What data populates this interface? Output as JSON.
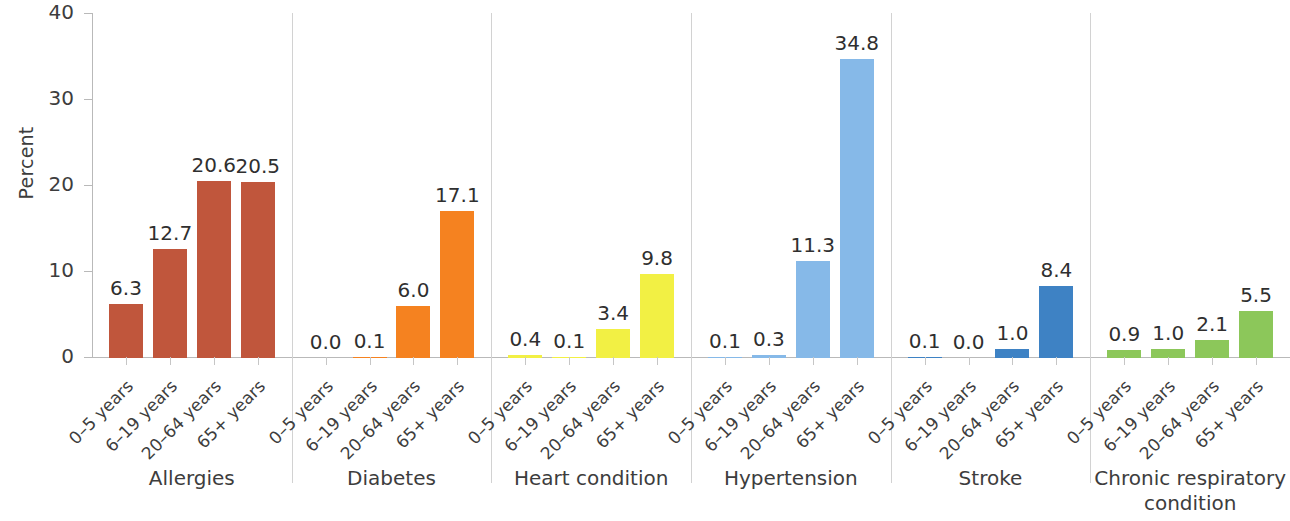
{
  "chart_data": {
    "type": "bar",
    "title": "",
    "xlabel": "",
    "ylabel": "Percent",
    "ylim": [
      0,
      40
    ],
    "yticks": [
      0,
      10,
      20,
      30,
      40
    ],
    "ytick_labels": [
      "0",
      "10",
      "20",
      "30",
      "40"
    ],
    "grid": false,
    "legend": "none",
    "categories": [
      "0–5 years",
      "6–19 years",
      "20–64 years",
      "65+ years"
    ],
    "groups": [
      {
        "name": "Allergies",
        "color": "#C0563C",
        "categories": [
          "0–5 years",
          "6–19 years",
          "20–64 years",
          "65+ years"
        ],
        "values": [
          6.3,
          12.7,
          20.6,
          20.5
        ],
        "value_labels": [
          "6.3",
          "12.7",
          "20.6",
          "20.5"
        ]
      },
      {
        "name": "Diabetes",
        "color": "#F58220",
        "categories": [
          "0–5 years",
          "6–19 years",
          "20–64 years",
          "65+ years"
        ],
        "values": [
          0.0,
          0.1,
          6.0,
          17.1
        ],
        "value_labels": [
          "0.0",
          "0.1",
          "6.0",
          "17.1"
        ]
      },
      {
        "name": "Heart condition",
        "color": "#F2F044",
        "categories": [
          "0–5 years",
          "6–19 years",
          "20–64 years",
          "65+ years"
        ],
        "values": [
          0.4,
          0.1,
          3.4,
          9.8
        ],
        "value_labels": [
          "0.4",
          "0.1",
          "3.4",
          "9.8"
        ]
      },
      {
        "name": "Hypertension",
        "color": "#86B9E8",
        "categories": [
          "0–5 years",
          "6–19 years",
          "20–64 years",
          "65+ years"
        ],
        "values": [
          0.1,
          0.3,
          11.3,
          34.8
        ],
        "value_labels": [
          "0.1",
          "0.3",
          "11.3",
          "34.8"
        ]
      },
      {
        "name": "Stroke",
        "color": "#3E82C4",
        "categories": [
          "0–5 years",
          "6–19 years",
          "20–64 years",
          "65+ years"
        ],
        "values": [
          0.1,
          0.0,
          1.0,
          8.4
        ],
        "value_labels": [
          "0.1",
          "0.0",
          "1.0",
          "8.4"
        ]
      },
      {
        "name": "Chronic respiratory condition",
        "name_lines": [
          "Chronic respiratory",
          "condition"
        ],
        "color": "#8CC75A",
        "categories": [
          "0–5 years",
          "6–19 years",
          "20–64 years",
          "65+ years"
        ],
        "values": [
          0.9,
          1.0,
          2.1,
          5.5
        ],
        "value_labels": [
          "0.9",
          "1.0",
          "2.1",
          "5.5"
        ]
      }
    ]
  },
  "axis": {
    "y_title": "Percent",
    "y_tick_labels": [
      "0",
      "10",
      "20",
      "30",
      "40"
    ]
  }
}
